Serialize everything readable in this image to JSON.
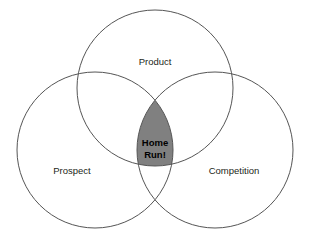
{
  "diagram": {
    "type": "venn-3-set",
    "background_color": "#ffffff",
    "stroke_color": "#555555",
    "label_color": "#231f20",
    "core_fill_color": "#808080",
    "core_text_color": "#000000",
    "sets": [
      {
        "id": "product",
        "label": "Product",
        "center_x": 155,
        "center_y": 88,
        "radius": 78,
        "label_x": 155,
        "label_y": 62
      },
      {
        "id": "prospect",
        "label": "Prospect",
        "center_x": 95,
        "center_y": 150,
        "radius": 78,
        "label_x": 72,
        "label_y": 171
      },
      {
        "id": "competition",
        "label": "Competition",
        "center_x": 215,
        "center_y": 150,
        "radius": 78,
        "label_x": 234,
        "label_y": 171
      }
    ],
    "core": {
      "id": "home-run",
      "label_line_1": "Home",
      "label_line_2": "Run!",
      "label_x": 155,
      "label_y_line_1": 143,
      "label_y_line_2": 155
    }
  }
}
